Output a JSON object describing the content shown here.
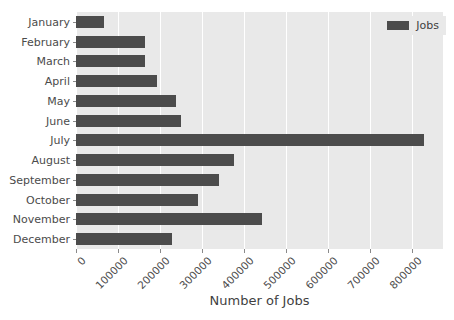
{
  "chart_data": {
    "type": "bar",
    "orientation": "horizontal",
    "title": "",
    "xlabel": "Number of Jobs",
    "ylabel": "",
    "grid": true,
    "legend_position": "upper right",
    "xlim": [
      0,
      874000
    ],
    "xticks": [
      0,
      100000,
      200000,
      300000,
      400000,
      500000,
      600000,
      700000,
      800000
    ],
    "xtick_labels": [
      "0",
      "100000",
      "200000",
      "300000",
      "400000",
      "500000",
      "600000",
      "700000",
      "800000"
    ],
    "categories": [
      "January",
      "February",
      "March",
      "April",
      "May",
      "June",
      "July",
      "August",
      "September",
      "October",
      "November",
      "December"
    ],
    "series": [
      {
        "name": "Jobs",
        "color": "#4c4c4c",
        "values": [
          67000,
          164000,
          165000,
          193000,
          238000,
          250000,
          829000,
          376000,
          340000,
          290000,
          443000,
          228000
        ]
      }
    ]
  },
  "legend": {
    "entries": [
      {
        "label": "Jobs",
        "color": "#4c4c4c"
      }
    ]
  },
  "style": {
    "plot_background": "#e9e9e9",
    "figure_background": "#ffffff",
    "gridline_color": "#ffffff",
    "tick_color": "#8a8a8a",
    "text_color": "#4b4b4b"
  }
}
